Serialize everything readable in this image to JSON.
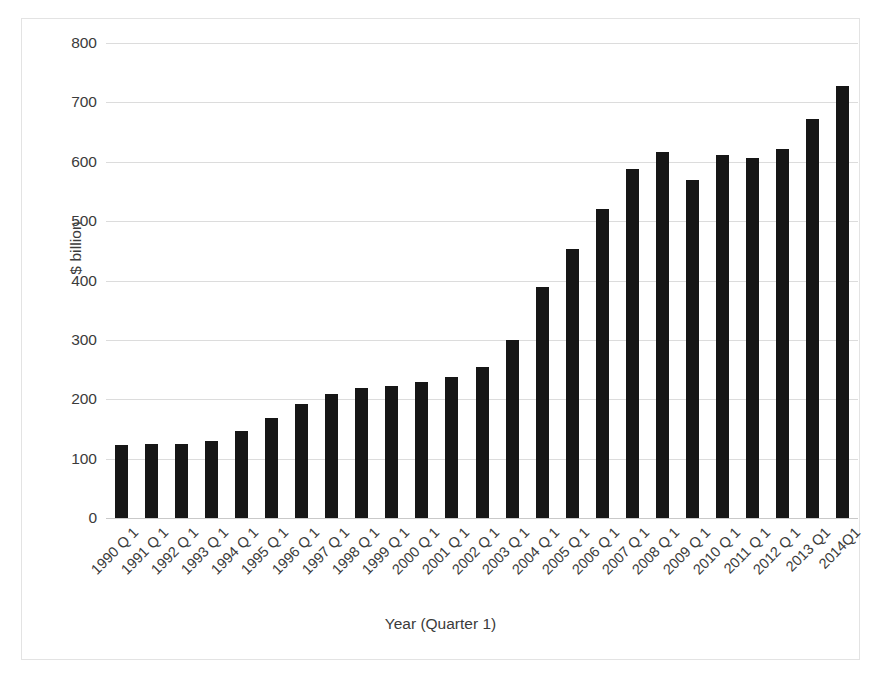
{
  "chart_data": {
    "type": "bar",
    "title": "",
    "subtitle": "",
    "xlabel": "Year (Quarter 1)",
    "ylabel": "$ billion",
    "ylim": [
      0,
      800
    ],
    "ytick_step": 100,
    "yticks": [
      800,
      700,
      600,
      500,
      400,
      300,
      200,
      100,
      0
    ],
    "grid": true,
    "legend": false,
    "legend_position": "none",
    "bar_color": "#161616",
    "gridline_color": "#dcdcdc",
    "frame_color": "#e3e3e3",
    "text_color": "#3b3b3b",
    "xtick_rotation": -45,
    "categories": [
      "1990 Q 1",
      "1991 Q 1",
      "1992 Q 1",
      "1993 Q 1",
      "1994 Q 1",
      "1995 Q 1",
      "1996 Q 1",
      "1997 Q 1",
      "1998 Q 1",
      "1999 Q 1",
      "2000 Q 1",
      "2001 Q 1",
      "2002 Q 1",
      "2003 Q 1",
      "2004 Q 1",
      "2005 Q 1",
      "2006 Q 1",
      "2007 Q 1",
      "2008 Q 1",
      "2009 Q 1",
      "2010 Q 1",
      "2011 Q 1",
      "2012 Q 1",
      "2013 Q1",
      "2014Q1"
    ],
    "values": [
      123,
      124,
      124,
      130,
      146,
      168,
      192,
      209,
      219,
      222,
      229,
      237,
      255,
      299,
      389,
      453,
      521,
      588,
      617,
      569,
      611,
      607,
      622,
      672,
      727
    ]
  }
}
